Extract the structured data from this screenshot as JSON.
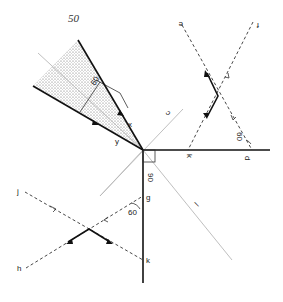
{
  "page_number": "50",
  "colors": {
    "ink": "#111111",
    "guide": "#b8b8b8",
    "shade": "#c9c9c9"
  },
  "labels": {
    "x": "x",
    "y": "y",
    "c": "c",
    "l": "l",
    "e": "e",
    "f": "f",
    "d": "d",
    "k_top": "k",
    "g": "g",
    "k": "k",
    "j": "j",
    "h": "h"
  },
  "angles": {
    "shaded_angle": "60",
    "right_angle": "90",
    "upper_right_angle": "60",
    "lower_left_angle": "60"
  }
}
